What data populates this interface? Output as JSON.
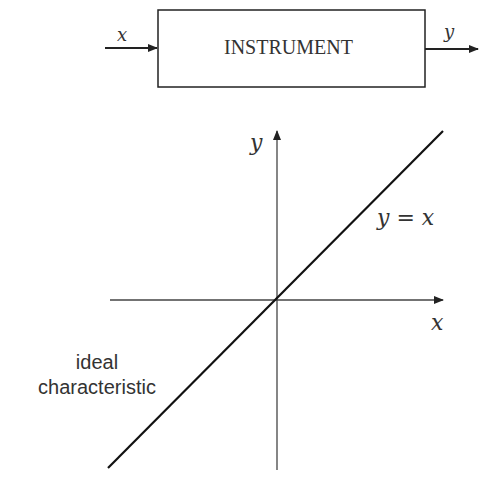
{
  "block_diagram": {
    "input_label": "x",
    "block_label": "INSTRUMENT",
    "output_label": "y"
  },
  "graph": {
    "y_axis_label": "y",
    "x_axis_label": "x",
    "line_equation": "y = x",
    "line_annotation_line1": "ideal",
    "line_annotation_line2": "characteristic"
  },
  "colors": {
    "stroke": "#222222",
    "axis": "#444444",
    "text": "#333333"
  }
}
